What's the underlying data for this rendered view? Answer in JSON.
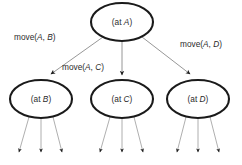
{
  "diagram": {
    "type": "search-tree",
    "background_color": "#ffffff",
    "node_stroke_color": "#1a1a1a",
    "edge_color": "#8b8b8b",
    "text_color": "#2b2b2b",
    "arrow_color": "#1d1d1d",
    "root": {
      "id": "root",
      "prefix": "(at ",
      "variable": "A",
      "suffix": ")",
      "full_label": "(at A)",
      "cx": 122,
      "cy": 22,
      "rx": 31,
      "ry": 19
    },
    "children": [
      {
        "id": "child-b",
        "prefix": "(at ",
        "variable": "B",
        "suffix": ")",
        "full_label": "(at B)",
        "cx": 41,
        "cy": 99,
        "rx": 31,
        "ry": 19,
        "edge_label": {
          "prefix": "move(",
          "var1": "A",
          "separator": ", ",
          "var2": "B",
          "suffix": ")",
          "full_label": "move(A, B)",
          "x": 14,
          "y": 40
        },
        "leaf_count": 3
      },
      {
        "id": "child-c",
        "prefix": "(at ",
        "variable": "C",
        "suffix": ")",
        "full_label": "(at C)",
        "cx": 122,
        "cy": 99,
        "rx": 31,
        "ry": 19,
        "edge_label": {
          "prefix": "move(",
          "var1": "A",
          "separator": ", ",
          "var2": "C",
          "suffix": ")",
          "full_label": "move(A, C)",
          "x": 62,
          "y": 70
        },
        "leaf_count": 3
      },
      {
        "id": "child-d",
        "prefix": "(at ",
        "variable": "D",
        "suffix": ")",
        "full_label": "(at D)",
        "cx": 198,
        "cy": 99,
        "rx": 31,
        "ry": 19,
        "edge_label": {
          "prefix": "move(",
          "var1": "A",
          "separator": ", ",
          "var2": "D",
          "suffix": ")",
          "full_label": "move(A, D)",
          "x": 180,
          "y": 47
        },
        "leaf_count": 3
      }
    ]
  }
}
